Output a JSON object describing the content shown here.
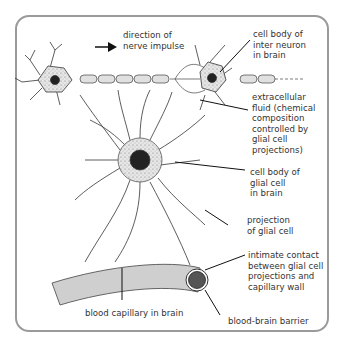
{
  "diagram": {
    "labels": {
      "direction": "direction of\nnerve impulse",
      "interneuron": "cell body of\ninter neuron\nin brain",
      "extracellular": "extracellular\nfluid (chemical\ncomposition\ncontrolled by\nglial cell\nprojections)",
      "glial_body": "cell body of\nglial cell\nin brain",
      "projection": "projection\nof glial cell",
      "contact": "intimate contact\nbetween glial cell\nprojections and\ncapillary wall",
      "capillary": "blood capillary in brain",
      "bbb": "blood-brain barrier"
    },
    "colors": {
      "stipple_fill": "#dcdcdc",
      "capillary_fill": "#cfcfcf",
      "nucleus": "#222222",
      "bbb_circle": "#555555",
      "frame": "#9a9a9a"
    }
  }
}
